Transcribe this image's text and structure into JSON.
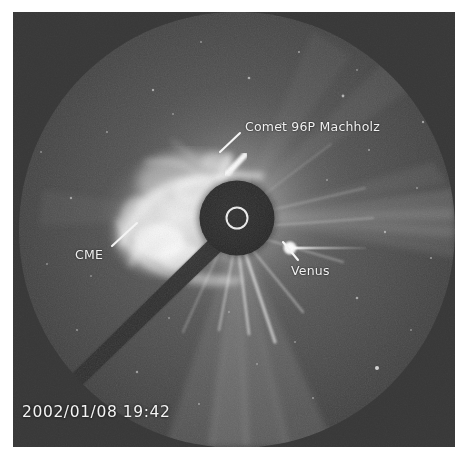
{
  "image": {
    "kind": "coronagraph-frame",
    "instrument_view": "white-light solar coronagraph",
    "timestamp": "2002/01/08 19:42",
    "background_color": "#3a3a3a",
    "field_of_view_color": "#4e4e4e",
    "occulter_color": "#2a2a2a",
    "label_color": "#f2f2f2",
    "frame": {
      "x": 13,
      "y": 12,
      "width": 442,
      "height": 435
    },
    "field_of_view": {
      "cx": 224,
      "cy": 218,
      "r": 218
    },
    "occulter_disk": {
      "cx": 224,
      "cy": 206,
      "r": 38
    },
    "sun_limb_circle": {
      "cx": 224,
      "cy": 206,
      "r": 11,
      "color": "#e8e8e8"
    }
  },
  "annotations": [
    {
      "id": "comet",
      "label": "Comet 96P Machholz",
      "label_x": 245,
      "label_y": 119,
      "pointer": {
        "x1": 240,
        "y1": 133,
        "x2": 222,
        "y2": 149
      },
      "target": {
        "x": 220,
        "y": 152
      }
    },
    {
      "id": "cme",
      "label": "CME",
      "label_x": 75,
      "label_y": 247,
      "pointer": {
        "x1": 112,
        "y1": 246,
        "x2": 135,
        "y2": 224
      },
      "target": {
        "x": 137,
        "y": 222
      }
    },
    {
      "id": "venus",
      "label": "Venus",
      "label_x": 291,
      "label_y": 263,
      "pointer": {
        "x1": 298,
        "y1": 259,
        "x2": 283,
        "y2": 243
      },
      "target": {
        "x": 278,
        "y": 238
      }
    }
  ],
  "features": {
    "venus_point": {
      "x": 277,
      "y": 237,
      "streak_to_x": 352
    },
    "comet_streak": {
      "x1": 216,
      "y1": 160,
      "x2": 231,
      "y2": 144
    },
    "pylon_arm": "dark diagonal occulter support running from lower-left to the central disk"
  }
}
